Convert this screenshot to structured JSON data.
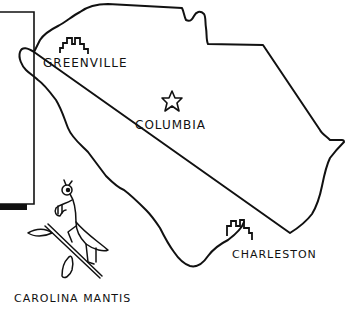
{
  "map": {
    "subject": "South Carolina state outline",
    "stroke_color": "#111111",
    "background_color": "#ffffff"
  },
  "cities": [
    {
      "name": "GREENVILLE",
      "marker": "skyline-icon"
    },
    {
      "name": "COLUMBIA",
      "marker": "star-icon"
    },
    {
      "name": "CHARLESTON",
      "marker": "skyline-icon"
    }
  ],
  "caption": {
    "mantis": "CAROLINA MANTIS"
  }
}
